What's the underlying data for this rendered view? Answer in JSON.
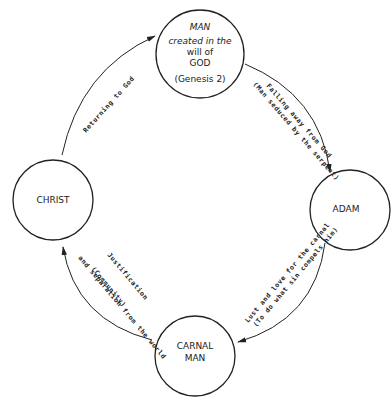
{
  "nodes": {
    "man": {
      "lines": [
        "MAN",
        "created in the",
        "will of",
        "GOD",
        "(Genesis 2)"
      ]
    },
    "adam": {
      "label": "ADAM"
    },
    "carnal_man": {
      "lines": [
        "CARNAL",
        "MAN"
      ]
    },
    "christ": {
      "label": "CHRIST"
    }
  },
  "edges": {
    "man_to_adam": {
      "line1": "Falling away from God",
      "line2": "(Man seduced by the serpent)"
    },
    "adam_to_carnal": {
      "line1": "Lust and love for the carnal",
      "line2": "(To do what sin compels him)"
    },
    "carnal_to_christ": {
      "line1": "Justification",
      "line2": "and separation from the world",
      "line3": "(Community)"
    },
    "christ_to_man": {
      "line1": "Returning to God"
    }
  },
  "colors": {
    "stroke": "#222222",
    "background": "#ffffff"
  }
}
